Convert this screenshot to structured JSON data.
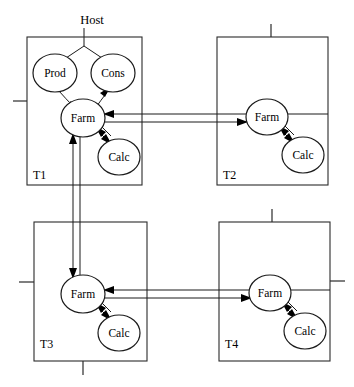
{
  "diagram": {
    "title": "Host",
    "host_label": "Host",
    "background_color": "#ffffff",
    "line_color": "#1a1a1a",
    "text_color": "#000000",
    "width": 354,
    "height": 387,
    "boxes": [
      {
        "id": "T1",
        "label": "T1",
        "x": 27,
        "y": 37,
        "w": 115,
        "h": 148,
        "label_x": 33,
        "label_y": 176,
        "ticks": [
          {
            "name": "left-tick",
            "x1": 13,
            "y1": 101,
            "x2": 27,
            "y2": 101
          }
        ],
        "nodes": [
          {
            "id": "T1-prod",
            "label": "Prod",
            "cx": 55,
            "cy": 73,
            "rx": 22,
            "ry": 19
          },
          {
            "id": "T1-cons",
            "label": "Cons",
            "cx": 113,
            "cy": 73,
            "rx": 22,
            "ry": 19
          },
          {
            "id": "T1-farm",
            "label": "Farm",
            "cx": 83,
            "cy": 118,
            "rx": 22,
            "ry": 19
          },
          {
            "id": "T1-calc",
            "label": "Calc",
            "cx": 119,
            "cy": 157,
            "rx": 21,
            "ry": 18
          }
        ]
      },
      {
        "id": "T2",
        "label": "T2",
        "x": 217,
        "y": 37,
        "w": 111,
        "h": 148,
        "label_x": 223,
        "label_y": 176,
        "ticks": [
          {
            "name": "top-tick",
            "x1": 271,
            "y1": 24,
            "x2": 271,
            "y2": 37
          }
        ],
        "nodes": [
          {
            "id": "T2-farm",
            "label": "Farm",
            "cx": 267,
            "cy": 117,
            "rx": 21,
            "ry": 18
          },
          {
            "id": "T2-calc",
            "label": "Calc",
            "cx": 303,
            "cy": 155,
            "rx": 21,
            "ry": 18
          }
        ]
      },
      {
        "id": "T3",
        "label": "T3",
        "x": 34,
        "y": 222,
        "w": 113,
        "h": 139,
        "label_x": 40,
        "label_y": 345,
        "ticks": [
          {
            "name": "left-tick",
            "x1": 19,
            "y1": 282,
            "x2": 34,
            "y2": 282
          },
          {
            "name": "bottom-tick",
            "x1": 83,
            "y1": 361,
            "x2": 83,
            "y2": 375
          }
        ],
        "nodes": [
          {
            "id": "T3-farm",
            "label": "Farm",
            "cx": 83,
            "cy": 294,
            "rx": 22,
            "ry": 19
          },
          {
            "id": "T3-calc",
            "label": "Calc",
            "cx": 119,
            "cy": 333,
            "rx": 21,
            "ry": 18
          }
        ]
      },
      {
        "id": "T4",
        "label": "T4",
        "x": 219,
        "y": 222,
        "w": 111,
        "h": 139,
        "label_x": 225,
        "label_y": 345,
        "ticks": [
          {
            "name": "top-tick",
            "x1": 272,
            "y1": 209,
            "x2": 272,
            "y2": 222
          },
          {
            "name": "right-tick",
            "x1": 330,
            "y1": 281,
            "x2": 345,
            "y2": 281
          }
        ],
        "nodes": [
          {
            "id": "T4-farm",
            "label": "Farm",
            "cx": 270,
            "cy": 293,
            "rx": 21,
            "ry": 18
          },
          {
            "id": "T4-calc",
            "label": "Calc",
            "cx": 305,
            "cy": 331,
            "rx": 21,
            "ry": 18
          }
        ]
      }
    ],
    "host": {
      "label": "Host",
      "label_x": 92,
      "label_y": 20,
      "stem_x": 84,
      "stem_y1": 28,
      "stem_y2": 46,
      "branch_left": {
        "x1": 84,
        "y1": 46,
        "x2": 64,
        "y2": 58
      },
      "branch_right": {
        "x1": 84,
        "y1": 46,
        "x2": 104,
        "y2": 58
      }
    },
    "edges": [
      {
        "name": "prod-to-farm-t1",
        "from": "T1-prod",
        "to": "T1-farm",
        "style": "curved-single"
      },
      {
        "name": "cons-to-farm-t1",
        "from": "T1-cons",
        "to": "T1-farm",
        "style": "curved-single"
      },
      {
        "name": "farm-calc-t1",
        "from": "T1-farm",
        "to": "T1-calc",
        "style": "double-bidirectional"
      },
      {
        "name": "farm-calc-t2",
        "from": "T2-farm",
        "to": "T2-calc",
        "style": "double-bidirectional"
      },
      {
        "name": "farm-calc-t3",
        "from": "T3-farm",
        "to": "T3-calc",
        "style": "double-bidirectional"
      },
      {
        "name": "farm-calc-t4",
        "from": "T4-farm",
        "to": "T4-calc",
        "style": "double-bidirectional"
      },
      {
        "name": "farm-t1-farm-t2",
        "from": "T1-farm",
        "to": "T2-farm",
        "style": "double-horizontal"
      },
      {
        "name": "farm-t3-farm-t4",
        "from": "T3-farm",
        "to": "T4-farm",
        "style": "double-horizontal"
      },
      {
        "name": "farm-t1-farm-t3",
        "from": "T1-farm",
        "to": "T3-farm",
        "style": "double-vertical"
      }
    ]
  }
}
